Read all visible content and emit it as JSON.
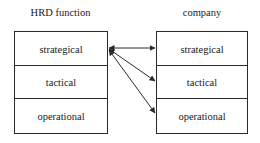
{
  "diagram": {
    "left": {
      "title": "HRD function",
      "levels": [
        "strategical",
        "tactical",
        "operational"
      ]
    },
    "right": {
      "title": "company",
      "levels": [
        "strategical",
        "tactical",
        "operational"
      ]
    },
    "arrows": [
      {
        "from": "HRD function.strategical",
        "to": "company.strategical",
        "bidirectional": true
      },
      {
        "from": "HRD function.strategical",
        "to": "company.tactical",
        "bidirectional": true
      },
      {
        "from": "HRD function.strategical",
        "to": "company.operational",
        "bidirectional": true
      }
    ],
    "line_color": "#2a2a2a"
  }
}
